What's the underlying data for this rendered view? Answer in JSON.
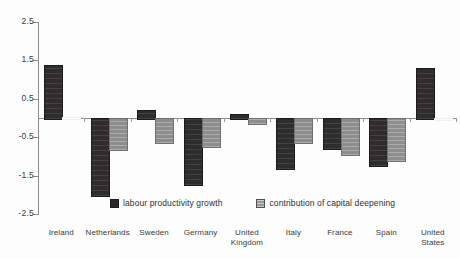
{
  "chart_data": {
    "type": "bar",
    "title": "",
    "subtitle": "",
    "xlabel": "",
    "ylabel": "",
    "ylim": [
      -2.5,
      2.5
    ],
    "ytick_labels": [
      "2.5",
      "1.5",
      "0.5",
      "-0.5",
      "-1.5",
      "-2.5"
    ],
    "ytick_values": [
      2.5,
      1.5,
      0.5,
      -0.5,
      -1.5,
      -2.5
    ],
    "grid": false,
    "legend_position": "inside-bottom",
    "categories": [
      "Ireland",
      "Netherlands",
      "Sweden",
      "Germany",
      "United Kingdom",
      "Italy",
      "France",
      "Spain",
      "United States"
    ],
    "series": [
      {
        "name": "labour productivity growth",
        "color": "#2e2c2d",
        "values": [
          1.37,
          -2.0,
          0.22,
          -1.72,
          0.1,
          -1.3,
          -0.78,
          -1.22,
          1.3
        ]
      },
      {
        "name": "contribution of capital deepening",
        "color": "#8d8d8e",
        "values": [
          0.02,
          -0.82,
          -0.62,
          -0.72,
          -0.13,
          -0.62,
          -0.93,
          -1.1,
          0.0
        ]
      }
    ]
  },
  "legend": {
    "items": [
      {
        "label": "labour productivity growth",
        "swatch": "dark-square-icon"
      },
      {
        "label": "contribution of capital deepening",
        "swatch": "hatched-square-icon"
      }
    ]
  }
}
